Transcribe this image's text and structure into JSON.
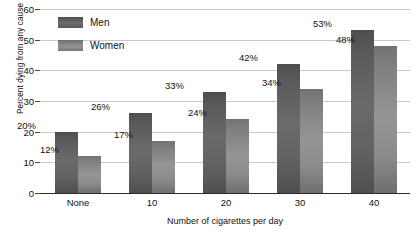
{
  "chart_data": {
    "type": "bar",
    "title": "",
    "xlabel": "Number of cigarettes per day",
    "ylabel": "Percent dying from any cause",
    "categories": [
      "None",
      "10",
      "20",
      "30",
      "40"
    ],
    "series": [
      {
        "name": "Men",
        "values": [
          20,
          26,
          33,
          42,
          53
        ],
        "color": "#5b5b5b",
        "labels": [
          "20%",
          "26%",
          "33%",
          "42%",
          "53%"
        ]
      },
      {
        "name": "Women",
        "values": [
          12,
          17,
          24,
          34,
          48
        ],
        "color": "#8a8a8a",
        "labels": [
          "12%",
          "17%",
          "24%",
          "34%",
          "48%"
        ]
      }
    ],
    "ylim": [
      0,
      60
    ],
    "yticks": [
      0,
      10,
      20,
      30,
      40,
      50,
      60
    ],
    "ytick_labels": [
      "0",
      "10",
      "20",
      "30",
      "40",
      "50",
      "60"
    ],
    "grid": true,
    "legend_position": "top-left-inside"
  }
}
